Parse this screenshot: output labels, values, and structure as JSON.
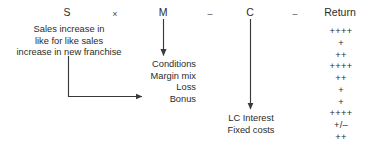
{
  "diagram": {
    "title_row": [
      {
        "label": "S",
        "kind": "term",
        "x": 67
      },
      {
        "label": "×",
        "kind": "operator",
        "x": 115
      },
      {
        "label": "M",
        "kind": "term",
        "x": 163
      },
      {
        "label": "–",
        "kind": "operator",
        "x": 210
      },
      {
        "label": "C",
        "kind": "term",
        "x": 250
      },
      {
        "label": "–",
        "kind": "operator",
        "x": 295
      },
      {
        "label": "Return",
        "kind": "term",
        "x": 340
      }
    ],
    "sales_block": {
      "lines": [
        "Sales increase in",
        "like for like sales",
        "increase in new franchise"
      ]
    },
    "margin_block": {
      "lines": [
        "Conditions",
        "Margin mix",
        "Loss",
        "Bonus"
      ]
    },
    "cost_block": {
      "lines": [
        "LC Interest",
        "Fixed costs"
      ]
    },
    "return_column": {
      "values": [
        "++++",
        "+",
        "++",
        "++++",
        "++",
        "+",
        "+",
        "++++",
        "+/–",
        "++"
      ]
    },
    "colors": {
      "text": "#2b2b2b",
      "operator": "#4a4a4a",
      "arrow": "#3a3a3a",
      "background": "#ffffff"
    }
  }
}
